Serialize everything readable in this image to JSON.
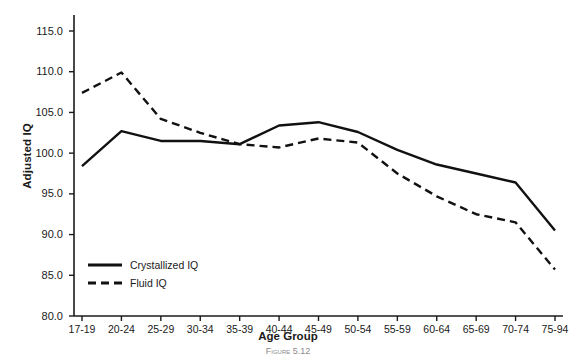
{
  "figure": {
    "caption": "Figure 5.12"
  },
  "chart_data": {
    "type": "line",
    "title": "",
    "xlabel": "Age Group",
    "ylabel": "Adjusted IQ",
    "categories": [
      "17-19",
      "20-24",
      "25-29",
      "30-34",
      "35-39",
      "40-44",
      "45-49",
      "50-54",
      "55-59",
      "60-64",
      "65-69",
      "70-74",
      "75-94"
    ],
    "ylim": [
      80.0,
      115.0
    ],
    "yticks": [
      "80.0",
      "85.0",
      "90.0",
      "95.0",
      "100.0",
      "105.0",
      "110.0",
      "115.0"
    ],
    "ytick_values": [
      80.0,
      85.0,
      90.0,
      95.0,
      100.0,
      105.0,
      110.0,
      115.0
    ],
    "grid": false,
    "legend_position": "bottom-left",
    "series": [
      {
        "name": "Crystallized IQ",
        "style": "solid",
        "color": "#111111",
        "values": [
          98.4,
          102.7,
          101.5,
          101.5,
          101.1,
          103.4,
          103.8,
          102.6,
          100.4,
          98.6,
          97.5,
          96.4,
          90.5
        ]
      },
      {
        "name": "Fluid IQ",
        "style": "dashed",
        "color": "#111111",
        "values": [
          107.4,
          109.9,
          104.2,
          102.5,
          101.1,
          100.7,
          101.8,
          101.3,
          97.5,
          94.7,
          92.5,
          91.5,
          85.7
        ]
      }
    ]
  }
}
